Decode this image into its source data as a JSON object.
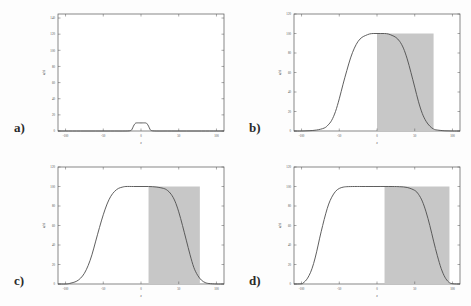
{
  "figure": {
    "background_color": "#fdfdfd",
    "curve_color": "#4d4d4d",
    "shade_color": "#c7c7c7",
    "axis_color": "#555555"
  },
  "panels": [
    {
      "letter": "a)",
      "xlabel": "x",
      "ylabel": "u(x)",
      "xticks": [
        "-100",
        "-50",
        "0",
        "50",
        "100"
      ],
      "yticks": [
        "0",
        "20",
        "40",
        "60",
        "80",
        "100",
        "120",
        "140"
      ]
    },
    {
      "letter": "b)",
      "xlabel": "x",
      "ylabel": "u(x)",
      "xticks": [
        "-100",
        "-50",
        "0",
        "50",
        "100"
      ],
      "yticks": [
        "0",
        "20",
        "40",
        "60",
        "80",
        "100",
        "120"
      ]
    },
    {
      "letter": "c)",
      "xlabel": "x",
      "ylabel": "u(x)",
      "xticks": [
        "-100",
        "-50",
        "0",
        "50",
        "100"
      ],
      "yticks": [
        "0",
        "20",
        "40",
        "60",
        "80",
        "100",
        "120"
      ]
    },
    {
      "letter": "d)",
      "xlabel": "x",
      "ylabel": "u(x)",
      "xticks": [
        "-100",
        "-50",
        "0",
        "50",
        "100"
      ],
      "yticks": [
        "0",
        "20",
        "40",
        "60",
        "80",
        "100",
        "120"
      ]
    }
  ],
  "chart_data": [
    {
      "type": "line",
      "title": "",
      "panel": "a)",
      "xlabel": "x",
      "ylabel": "u(x)",
      "xlim": [
        -110,
        110
      ],
      "ylim": [
        0,
        145
      ],
      "xticks": [
        -100,
        -50,
        0,
        50,
        100
      ],
      "yticks": [
        0,
        20,
        40,
        60,
        80,
        100,
        120,
        140
      ],
      "grid": false,
      "legend": "none",
      "series": [
        {
          "name": "u(x)",
          "x": [
            -110,
            -100,
            -80,
            -60,
            -40,
            -20,
            -14,
            -12,
            -10,
            -8,
            -6,
            0,
            6,
            8,
            10,
            12,
            14,
            20,
            40,
            60,
            80,
            100,
            110
          ],
          "y": [
            0,
            0,
            0,
            0,
            0,
            0,
            0.5,
            2,
            6,
            9,
            10,
            10,
            10,
            9,
            6,
            2,
            0.5,
            0,
            0,
            0,
            0,
            0,
            0
          ]
        }
      ],
      "shaded_region": null
    },
    {
      "type": "line",
      "title": "",
      "panel": "b)",
      "xlabel": "x",
      "ylabel": "u(x)",
      "xlim": [
        -110,
        110
      ],
      "ylim": [
        0,
        120
      ],
      "xticks": [
        -100,
        -50,
        0,
        50,
        100
      ],
      "yticks": [
        0,
        20,
        40,
        60,
        80,
        100,
        120
      ],
      "grid": false,
      "legend": "none",
      "series": [
        {
          "name": "u(x)",
          "x": [
            -110,
            -100,
            -90,
            -80,
            -70,
            -65,
            -60,
            -55,
            -50,
            -45,
            -40,
            -35,
            -30,
            -25,
            -20,
            -15,
            -10,
            -5,
            0,
            5,
            10,
            15,
            20,
            25,
            30,
            35,
            40,
            45,
            50,
            55,
            60,
            65,
            70,
            75,
            80,
            90,
            100,
            110
          ],
          "y": [
            0,
            0,
            0.3,
            1,
            3,
            6,
            11,
            20,
            33,
            48,
            62,
            75,
            85,
            92,
            96,
            98,
            99.5,
            100,
            100,
            100,
            100,
            99.5,
            98,
            96,
            92,
            85,
            74,
            60,
            45,
            30,
            18,
            10,
            5,
            2,
            1,
            0.2,
            0,
            0
          ]
        }
      ],
      "shaded_region": {
        "x_start": 0,
        "x_end": 75,
        "y_bottom": 0,
        "y_top": 100
      }
    },
    {
      "type": "line",
      "title": "",
      "panel": "c)",
      "xlabel": "x",
      "ylabel": "u(x)",
      "xlim": [
        -110,
        110
      ],
      "ylim": [
        0,
        120
      ],
      "xticks": [
        -100,
        -50,
        0,
        50,
        100
      ],
      "yticks": [
        0,
        20,
        40,
        60,
        80,
        100,
        120
      ],
      "grid": false,
      "legend": "none",
      "series": [
        {
          "name": "u(x)",
          "x": [
            -110,
            -100,
            -95,
            -90,
            -85,
            -80,
            -75,
            -70,
            -65,
            -60,
            -55,
            -50,
            -45,
            -40,
            -35,
            -30,
            -25,
            -20,
            -10,
            0,
            10,
            20,
            30,
            35,
            40,
            45,
            50,
            55,
            60,
            65,
            70,
            75,
            80,
            85,
            90,
            100,
            110
          ],
          "y": [
            0,
            0,
            0.5,
            1.5,
            3,
            6,
            11,
            19,
            30,
            44,
            58,
            71,
            82,
            90,
            95,
            98,
            99.3,
            100,
            100,
            100,
            100,
            99.5,
            98,
            96,
            92,
            85,
            74,
            60,
            45,
            30,
            17,
            9,
            4,
            1.5,
            0.5,
            0,
            0
          ]
        }
      ],
      "shaded_region": {
        "x_start": 10,
        "x_end": 78,
        "y_bottom": 0,
        "y_top": 100
      }
    },
    {
      "type": "line",
      "title": "",
      "panel": "d)",
      "xlabel": "x",
      "ylabel": "u(x)",
      "xlim": [
        -110,
        110
      ],
      "ylim": [
        0,
        120
      ],
      "xticks": [
        -100,
        -50,
        0,
        50,
        100
      ],
      "yticks": [
        0,
        20,
        40,
        60,
        80,
        100,
        120
      ],
      "grid": false,
      "legend": "none",
      "series": [
        {
          "name": "u(x)",
          "x": [
            -110,
            -100,
            -98,
            -95,
            -92,
            -88,
            -84,
            -80,
            -76,
            -72,
            -68,
            -64,
            -60,
            -55,
            -50,
            -45,
            -40,
            -30,
            -20,
            0,
            20,
            30,
            40,
            50,
            55,
            60,
            65,
            70,
            75,
            80,
            85,
            90,
            95,
            100,
            110
          ],
          "y": [
            0,
            0.2,
            1,
            3,
            6,
            12,
            21,
            33,
            47,
            60,
            72,
            82,
            89,
            95,
            98,
            99.3,
            99.8,
            100,
            100,
            100,
            100,
            99.8,
            99,
            96,
            92,
            85,
            74,
            60,
            44,
            29,
            16,
            7,
            2,
            0.3,
            0
          ]
        }
      ],
      "shaded_region": {
        "x_start": 10,
        "x_end": 96,
        "y_bottom": 0,
        "y_top": 100
      }
    }
  ]
}
